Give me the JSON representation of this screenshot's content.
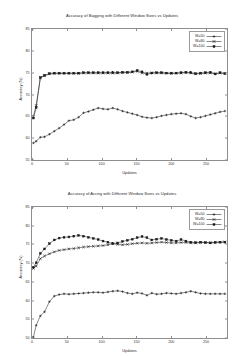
{
  "charts": [
    {
      "title": "Accuracy of Bagging with Different Window Sizes vs Updates",
      "xlabel": "Updates",
      "ylabel": "Accuracy (%)",
      "legend": [
        {
          "label": "W=50"
        },
        {
          "label": "W=80"
        },
        {
          "label": "W=100"
        }
      ]
    },
    {
      "title": "Accuracy of Arcing with Different Window Sizes vs Updates",
      "xlabel": "Updates",
      "ylabel": "Accuracy (%)",
      "legend": [
        {
          "label": "W=50"
        },
        {
          "label": "W=80"
        },
        {
          "label": "W=100"
        }
      ]
    }
  ],
  "chart_data": [
    {
      "type": "line",
      "title": "Accuracy of Bagging with Different Window Sizes vs Updates",
      "xlabel": "Updates",
      "ylabel": "Accuracy (%)",
      "xlim": [
        0,
        280
      ],
      "ylim": [
        55,
        85
      ],
      "xticks": [
        0,
        50,
        100,
        150,
        200,
        250
      ],
      "yticks": [
        55,
        60,
        65,
        70,
        75,
        80,
        85
      ],
      "grid": false,
      "legend_position": "top-right",
      "series": [
        {
          "name": "W=50",
          "marker": "plus",
          "x": [
            2,
            6,
            12,
            18,
            25,
            32,
            39,
            46,
            53,
            60,
            67,
            74,
            81,
            88,
            95,
            102,
            109,
            116,
            123,
            130,
            137,
            144,
            151,
            158,
            165,
            172,
            179,
            186,
            193,
            200,
            207,
            214,
            221,
            228,
            235,
            242,
            249,
            256,
            263,
            270,
            277
          ],
          "y": [
            58.9,
            59.3,
            60.2,
            60.3,
            60.9,
            61.6,
            62.3,
            63.1,
            64.0,
            64.2,
            64.8,
            65.8,
            66.1,
            66.5,
            66.9,
            66.7,
            66.6,
            66.9,
            66.6,
            66.2,
            65.9,
            65.6,
            65.3,
            64.9,
            64.7,
            64.6,
            64.8,
            65.1,
            65.3,
            65.5,
            65.6,
            65.7,
            65.5,
            65.0,
            64.6,
            64.8,
            65.1,
            65.4,
            65.7,
            66.0,
            66.2
          ]
        },
        {
          "name": "W=80",
          "marker": "cross",
          "x": [
            2,
            6,
            12,
            18,
            25,
            32,
            39,
            46,
            53,
            60,
            67,
            74,
            81,
            88,
            95,
            102,
            109,
            116,
            123,
            130,
            137,
            144,
            151,
            158,
            165,
            172,
            179,
            186,
            193,
            200,
            207,
            214,
            221,
            228,
            235,
            242,
            249,
            256,
            263,
            270,
            277
          ],
          "y": [
            65.0,
            67.5,
            73.8,
            74.3,
            74.7,
            74.8,
            74.8,
            74.8,
            74.8,
            74.8,
            74.8,
            74.9,
            74.9,
            74.9,
            74.9,
            74.9,
            74.9,
            74.9,
            74.9,
            75.0,
            75.0,
            75.1,
            75.3,
            74.9,
            74.9,
            75.0,
            74.9,
            74.9,
            74.9,
            74.8,
            74.9,
            74.9,
            75.0,
            74.9,
            74.7,
            74.8,
            74.9,
            74.9,
            74.8,
            74.9,
            74.8
          ]
        },
        {
          "name": "W=100",
          "marker": "square",
          "x": [
            2,
            6,
            12,
            18,
            25,
            32,
            39,
            46,
            53,
            60,
            67,
            74,
            81,
            88,
            95,
            102,
            109,
            116,
            123,
            130,
            137,
            144,
            151,
            158,
            165,
            172,
            179,
            186,
            193,
            200,
            207,
            214,
            221,
            228,
            235,
            242,
            249,
            256,
            263,
            270,
            277
          ],
          "y": [
            64.6,
            67.0,
            73.9,
            74.4,
            74.8,
            74.9,
            74.9,
            74.9,
            74.9,
            74.9,
            74.9,
            75.0,
            75.0,
            75.0,
            75.0,
            75.0,
            75.0,
            75.0,
            75.0,
            75.1,
            75.1,
            75.2,
            75.5,
            75.2,
            74.6,
            74.9,
            75.0,
            75.0,
            74.9,
            74.9,
            74.9,
            75.0,
            75.1,
            75.0,
            74.8,
            74.9,
            75.0,
            75.1,
            74.7,
            75.0,
            74.8
          ]
        }
      ]
    },
    {
      "type": "line",
      "title": "Accuracy of Arcing with Different Window Sizes vs Updates",
      "xlabel": "Updates",
      "ylabel": "Accuracy (%)",
      "xlim": [
        0,
        280
      ],
      "ylim": [
        50,
        85
      ],
      "xticks": [
        0,
        50,
        100,
        150,
        200,
        250
      ],
      "yticks": [
        50,
        55,
        60,
        65,
        70,
        75,
        80,
        85
      ],
      "grid": false,
      "legend_position": "top-right",
      "series": [
        {
          "name": "W=50",
          "marker": "plus",
          "x": [
            2,
            6,
            12,
            18,
            25,
            32,
            39,
            46,
            53,
            60,
            67,
            74,
            81,
            88,
            95,
            102,
            109,
            116,
            123,
            130,
            137,
            144,
            151,
            158,
            165,
            172,
            179,
            186,
            193,
            200,
            207,
            214,
            221,
            228,
            235,
            242,
            249,
            256,
            263,
            270,
            277
          ],
          "y": [
            50.2,
            53.4,
            55.9,
            57.0,
            59.7,
            61.2,
            61.6,
            61.8,
            61.7,
            61.8,
            61.9,
            62.0,
            62.1,
            62.2,
            62.2,
            62.1,
            62.3,
            62.5,
            62.6,
            62.4,
            62.0,
            61.8,
            62.1,
            61.9,
            61.4,
            62.0,
            61.7,
            61.8,
            62.0,
            61.9,
            61.8,
            62.0,
            62.2,
            62.5,
            62.2,
            61.9,
            61.8,
            61.8,
            61.8,
            61.8,
            61.8
          ]
        },
        {
          "name": "W=80",
          "marker": "cross",
          "x": [
            2,
            6,
            12,
            18,
            25,
            32,
            39,
            46,
            53,
            60,
            67,
            74,
            81,
            88,
            95,
            102,
            109,
            116,
            123,
            130,
            137,
            144,
            151,
            158,
            165,
            172,
            179,
            186,
            193,
            200,
            207,
            214,
            221,
            228,
            235,
            242,
            249,
            256,
            263,
            270,
            277
          ],
          "y": [
            68.6,
            69.2,
            71.2,
            71.9,
            72.5,
            73.0,
            73.4,
            73.6,
            73.8,
            73.9,
            74.1,
            74.3,
            74.4,
            74.5,
            74.6,
            74.7,
            74.9,
            75.2,
            75.0,
            74.9,
            75.0,
            75.2,
            75.3,
            75.4,
            75.3,
            75.4,
            75.5,
            75.6,
            75.5,
            75.4,
            75.4,
            75.5,
            75.5,
            75.4,
            75.4,
            75.5,
            75.5,
            75.5,
            75.6,
            75.6,
            75.7
          ]
        },
        {
          "name": "W=100",
          "marker": "square",
          "x": [
            2,
            6,
            12,
            18,
            25,
            32,
            39,
            46,
            53,
            60,
            67,
            74,
            81,
            88,
            95,
            102,
            109,
            116,
            123,
            130,
            137,
            144,
            151,
            158,
            165,
            172,
            179,
            186,
            193,
            200,
            207,
            214,
            221,
            228,
            235,
            242,
            249,
            256,
            263,
            270,
            277
          ],
          "y": [
            68.9,
            70.1,
            72.6,
            73.8,
            75.2,
            76.2,
            76.7,
            76.9,
            77.0,
            77.2,
            77.4,
            77.2,
            76.9,
            76.6,
            76.3,
            75.9,
            75.6,
            75.2,
            75.4,
            75.8,
            76.1,
            76.4,
            76.8,
            77.1,
            76.8,
            76.2,
            76.4,
            76.6,
            76.3,
            76.1,
            75.9,
            76.3,
            75.9,
            75.6,
            75.5,
            75.6,
            75.5,
            75.4,
            75.5,
            75.6,
            75.6
          ]
        }
      ]
    }
  ]
}
